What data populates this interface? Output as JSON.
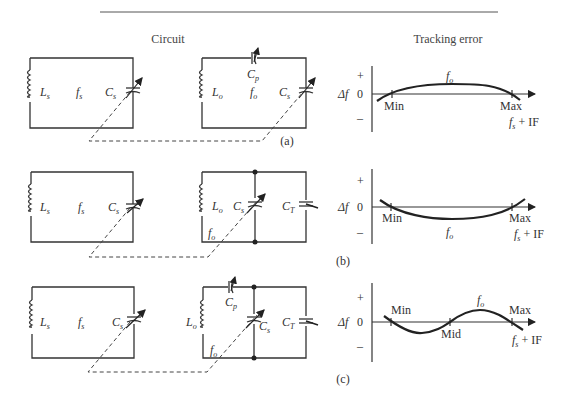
{
  "header": {
    "circuit_title": "Circuit",
    "tracking_title": "Tracking error"
  },
  "rows": [
    {
      "caption": "(a)",
      "rf_circuit": {
        "inductor": "L",
        "inductor_sub": "s",
        "freq": "f",
        "freq_sub": "s",
        "cap": "C",
        "cap_sub": "s"
      },
      "osc_circuit": {
        "inductor": "L",
        "inductor_sub": "o",
        "freq": "f",
        "freq_sub": "o",
        "cap": "C",
        "cap_sub": "s",
        "padder": "C",
        "padder_sub": "p"
      },
      "graph": {
        "y_label": "Δf",
        "plus": "+",
        "zero": "0",
        "minus": "–",
        "curve_label": "f",
        "curve_sub": "o",
        "markers": [
          "Min",
          "Max"
        ],
        "x_label": "f",
        "x_sub": "s",
        "x_suffix": " + IF"
      }
    },
    {
      "caption": "(b)",
      "rf_circuit": {
        "inductor": "L",
        "inductor_sub": "s",
        "freq": "f",
        "freq_sub": "s",
        "cap": "C",
        "cap_sub": "s"
      },
      "osc_circuit": {
        "inductor": "L",
        "inductor_sub": "o",
        "freq": "f",
        "freq_sub": "o",
        "cap": "C",
        "cap_sub": "s",
        "trimmer": "C",
        "trimmer_sub": "T"
      },
      "graph": {
        "y_label": "Δf",
        "plus": "+",
        "zero": "0",
        "minus": "–",
        "curve_label": "f",
        "curve_sub": "o",
        "markers": [
          "Min",
          "Max"
        ],
        "x_label": "f",
        "x_sub": "s",
        "x_suffix": " + IF"
      }
    },
    {
      "caption": "(c)",
      "rf_circuit": {
        "inductor": "L",
        "inductor_sub": "s",
        "freq": "f",
        "freq_sub": "s",
        "cap": "C",
        "cap_sub": "s"
      },
      "osc_circuit": {
        "inductor": "L",
        "inductor_sub": "o",
        "freq": "f",
        "freq_sub": "o",
        "cap": "C",
        "cap_sub": "s",
        "padder": "C",
        "padder_sub": "p",
        "trimmer": "C",
        "trimmer_sub": "T"
      },
      "graph": {
        "y_label": "Δf",
        "plus": "+",
        "zero": "0",
        "minus": "–",
        "curve_label": "f",
        "curve_sub": "o",
        "markers": [
          "Min",
          "Mid",
          "Max"
        ],
        "x_label": "f",
        "x_sub": "s",
        "x_suffix": " + IF"
      }
    }
  ]
}
